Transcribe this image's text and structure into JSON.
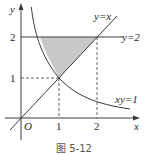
{
  "figure": {
    "caption": "图 5-12",
    "axes": {
      "x_label": "x",
      "y_label": "y",
      "origin_label": "O",
      "x_ticks": [
        "1",
        "2"
      ],
      "y_ticks": [
        "1",
        "2"
      ]
    },
    "curves": [
      {
        "name": "line-y-equals-x",
        "label": "y=x"
      },
      {
        "name": "line-y-equals-2",
        "label": "y=2"
      },
      {
        "name": "hyperbola-xy-equals-1",
        "label": "xy=1"
      }
    ],
    "shaded_region": "bounded by xy=1, y=x, and y=2",
    "colors": {
      "stroke": "#3a3a3a",
      "shade": "#c8c8c8"
    }
  }
}
